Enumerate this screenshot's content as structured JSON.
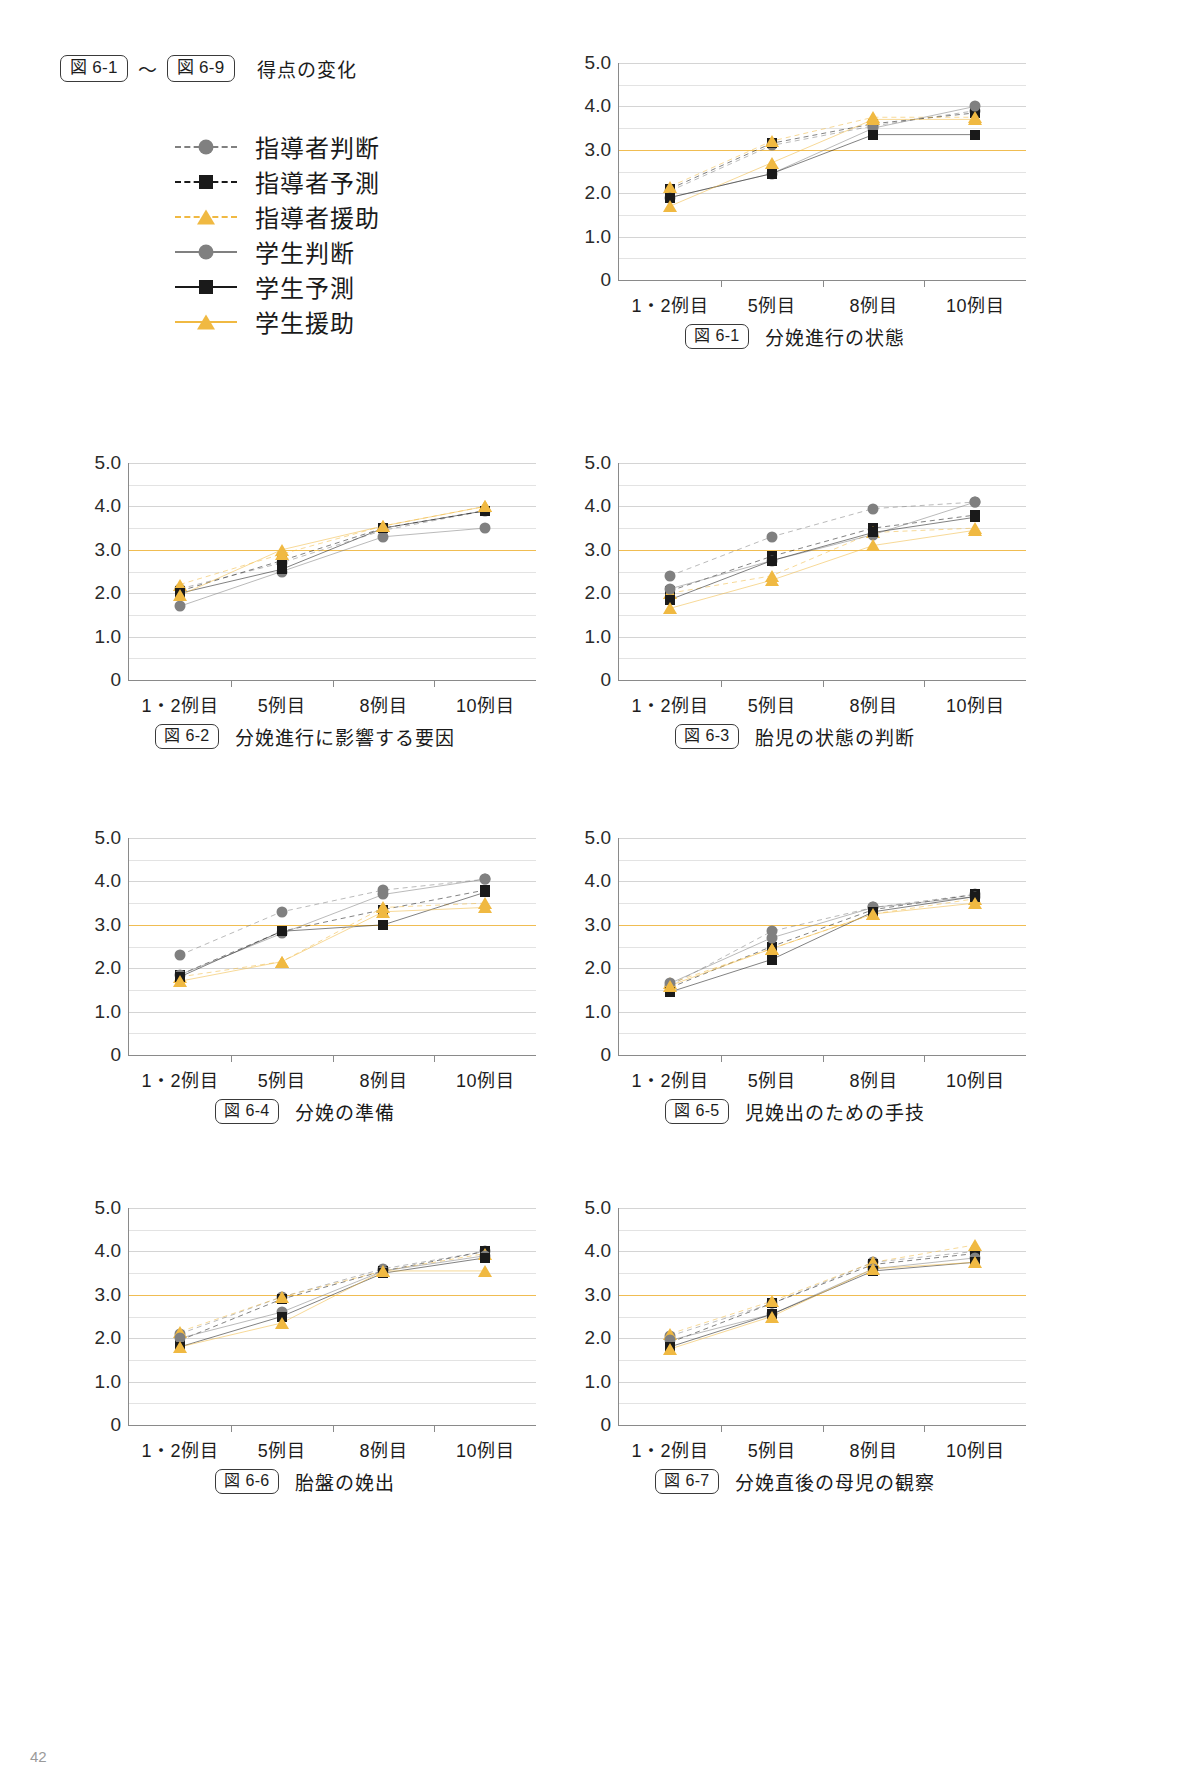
{
  "header": {
    "tag_start": "図 6-1",
    "tilde": "〜",
    "tag_end": "図 6-9",
    "title": "得点の変化"
  },
  "colors": {
    "gray": "#808080",
    "black": "#1a1a1a",
    "orange": "#f0b942",
    "refline": "#f0bd52",
    "grid": "#e3e3e3",
    "axis": "#8a8a8a"
  },
  "legend": {
    "items": [
      {
        "label": "指導者判断",
        "marker": "circle",
        "color": "#808080",
        "dash": true
      },
      {
        "label": "指導者予測",
        "marker": "square",
        "color": "#1a1a1a",
        "dash": true
      },
      {
        "label": "指導者援助",
        "marker": "triangle",
        "color": "#f0b942",
        "dash": true
      },
      {
        "label": "学生判断",
        "marker": "circle",
        "color": "#808080",
        "dash": false
      },
      {
        "label": "学生予測",
        "marker": "square",
        "color": "#1a1a1a",
        "dash": false
      },
      {
        "label": "学生援助",
        "marker": "triangle",
        "color": "#f0b942",
        "dash": false
      }
    ]
  },
  "axis": {
    "ylim": [
      0,
      5.0
    ],
    "yticks": [
      "0",
      "1.0",
      "2.0",
      "3.0",
      "4.0",
      "5.0"
    ],
    "ytick_values": [
      0,
      1.0,
      2.0,
      3.0,
      4.0,
      5.0
    ],
    "minor_step": 0.5,
    "reference_line": 3.0,
    "categories": [
      "1・2例目",
      "5例目",
      "8例目",
      "10例目"
    ]
  },
  "chart_data": [
    {
      "id": "fig6-1",
      "type": "line",
      "tag": "図 6-1",
      "title": "分娩進行の状態",
      "categories": [
        "1・2例目",
        "5例目",
        "8例目",
        "10例目"
      ],
      "xlabel": "",
      "ylabel": "",
      "ylim": [
        0,
        5.0
      ],
      "grid": true,
      "reference_line": 3.0,
      "legend_position": "external-top-left",
      "series": [
        {
          "name": "指導者判断",
          "values": [
            2.05,
            3.1,
            3.55,
            3.9
          ]
        },
        {
          "name": "指導者予測",
          "values": [
            2.1,
            3.15,
            3.6,
            3.85
          ]
        },
        {
          "name": "指導者援助",
          "values": [
            2.15,
            3.2,
            3.75,
            3.75
          ]
        },
        {
          "name": "学生判断",
          "values": [
            1.9,
            2.45,
            3.5,
            4.0
          ]
        },
        {
          "name": "学生予測",
          "values": [
            1.9,
            2.45,
            3.35,
            3.35
          ]
        },
        {
          "name": "学生援助",
          "values": [
            1.7,
            2.7,
            3.7,
            3.7
          ]
        }
      ]
    },
    {
      "id": "fig6-2",
      "type": "line",
      "tag": "図 6-2",
      "title": "分娩進行に影響する要因",
      "categories": [
        "1・2例目",
        "5例目",
        "8例目",
        "10例目"
      ],
      "xlabel": "",
      "ylabel": "",
      "ylim": [
        0,
        5.0
      ],
      "grid": true,
      "reference_line": 3.0,
      "legend_position": "external-top-left",
      "series": [
        {
          "name": "指導者判断",
          "values": [
            2.1,
            2.7,
            3.45,
            3.9
          ]
        },
        {
          "name": "指導者予測",
          "values": [
            2.05,
            2.75,
            3.5,
            3.9
          ]
        },
        {
          "name": "指導者援助",
          "values": [
            2.2,
            2.9,
            3.55,
            4.0
          ]
        },
        {
          "name": "学生判断",
          "values": [
            1.7,
            2.5,
            3.3,
            3.5
          ]
        },
        {
          "name": "学生予測",
          "values": [
            2.0,
            2.55,
            3.5,
            3.9
          ]
        },
        {
          "name": "学生援助",
          "values": [
            1.95,
            3.0,
            3.55,
            4.0
          ]
        }
      ]
    },
    {
      "id": "fig6-3",
      "type": "line",
      "tag": "図 6-3",
      "title": "胎児の状態の判断",
      "categories": [
        "1・2例目",
        "5例目",
        "8例目",
        "10例目"
      ],
      "xlabel": "",
      "ylabel": "",
      "ylim": [
        0,
        5.0
      ],
      "grid": true,
      "reference_line": 3.0,
      "legend_position": "external-top-left",
      "series": [
        {
          "name": "指導者判断",
          "values": [
            2.4,
            3.3,
            3.95,
            4.1
          ]
        },
        {
          "name": "指導者予測",
          "values": [
            2.05,
            2.85,
            3.5,
            3.8
          ]
        },
        {
          "name": "指導者援助",
          "values": [
            2.0,
            2.4,
            3.4,
            3.5
          ]
        },
        {
          "name": "学生判断",
          "values": [
            2.1,
            2.75,
            3.35,
            4.1
          ]
        },
        {
          "name": "学生予測",
          "values": [
            1.85,
            2.75,
            3.4,
            3.75
          ]
        },
        {
          "name": "学生援助",
          "values": [
            1.65,
            2.3,
            3.1,
            3.45
          ]
        }
      ]
    },
    {
      "id": "fig6-4",
      "type": "line",
      "tag": "図 6-4",
      "title": "分娩の準備",
      "categories": [
        "1・2例目",
        "5例目",
        "8例目",
        "10例目"
      ],
      "xlabel": "",
      "ylabel": "",
      "ylim": [
        0,
        5.0
      ],
      "grid": true,
      "reference_line": 3.0,
      "legend_position": "external-top-left",
      "series": [
        {
          "name": "指導者判断",
          "values": [
            2.3,
            3.3,
            3.8,
            4.05
          ]
        },
        {
          "name": "指導者予測",
          "values": [
            1.85,
            2.85,
            3.35,
            3.8
          ]
        },
        {
          "name": "指導者援助",
          "values": [
            1.8,
            2.15,
            3.4,
            3.5
          ]
        },
        {
          "name": "学生判断",
          "values": [
            1.85,
            2.8,
            3.7,
            4.05
          ]
        },
        {
          "name": "学生予測",
          "values": [
            1.8,
            2.85,
            3.0,
            3.75
          ]
        },
        {
          "name": "学生援助",
          "values": [
            1.7,
            2.15,
            3.3,
            3.4
          ]
        }
      ]
    },
    {
      "id": "fig6-5",
      "type": "line",
      "tag": "図 6-5",
      "title": "児娩出のための手技",
      "categories": [
        "1・2例目",
        "5例目",
        "8例目",
        "10例目"
      ],
      "xlabel": "",
      "ylabel": "",
      "ylim": [
        0,
        5.0
      ],
      "grid": true,
      "reference_line": 3.0,
      "legend_position": "external-top-left",
      "series": [
        {
          "name": "指導者判断",
          "values": [
            1.6,
            2.85,
            3.4,
            3.7
          ]
        },
        {
          "name": "指導者予測",
          "values": [
            1.55,
            2.5,
            3.35,
            3.7
          ]
        },
        {
          "name": "指導者援助",
          "values": [
            1.65,
            2.45,
            3.25,
            3.6
          ]
        },
        {
          "name": "学生判断",
          "values": [
            1.65,
            2.7,
            3.4,
            3.65
          ]
        },
        {
          "name": "学生予測",
          "values": [
            1.45,
            2.2,
            3.3,
            3.65
          ]
        },
        {
          "name": "学生援助",
          "values": [
            1.6,
            2.45,
            3.25,
            3.5
          ]
        }
      ]
    },
    {
      "id": "fig6-6",
      "type": "line",
      "tag": "図 6-6",
      "title": "胎盤の娩出",
      "categories": [
        "1・2例目",
        "5例目",
        "8例目",
        "10例目"
      ],
      "xlabel": "",
      "ylabel": "",
      "ylim": [
        0,
        5.0
      ],
      "grid": true,
      "reference_line": 3.0,
      "legend_position": "external-top-left",
      "series": [
        {
          "name": "指導者判断",
          "values": [
            2.1,
            2.95,
            3.6,
            4.0
          ]
        },
        {
          "name": "指導者予測",
          "values": [
            1.95,
            2.9,
            3.55,
            4.0
          ]
        },
        {
          "name": "指導者援助",
          "values": [
            2.15,
            2.95,
            3.55,
            3.95
          ]
        },
        {
          "name": "学生判断",
          "values": [
            2.0,
            2.6,
            3.55,
            3.9
          ]
        },
        {
          "name": "学生予測",
          "values": [
            1.8,
            2.5,
            3.5,
            3.85
          ]
        },
        {
          "name": "学生援助",
          "values": [
            1.8,
            2.35,
            3.55,
            3.55
          ]
        }
      ]
    },
    {
      "id": "fig6-7",
      "type": "line",
      "tag": "図 6-7",
      "title": "分娩直後の母児の観察",
      "categories": [
        "1・2例目",
        "5例目",
        "8例目",
        "10例目"
      ],
      "xlabel": "",
      "ylabel": "",
      "ylim": [
        0,
        5.0
      ],
      "grid": true,
      "reference_line": 3.0,
      "legend_position": "external-top-left",
      "series": [
        {
          "name": "指導者判断",
          "values": [
            2.05,
            2.8,
            3.75,
            4.0
          ]
        },
        {
          "name": "指導者予測",
          "values": [
            1.9,
            2.8,
            3.7,
            3.95
          ]
        },
        {
          "name": "指導者援助",
          "values": [
            2.1,
            2.85,
            3.75,
            4.15
          ]
        },
        {
          "name": "学生判断",
          "values": [
            1.95,
            2.55,
            3.6,
            3.85
          ]
        },
        {
          "name": "学生予測",
          "values": [
            1.8,
            2.55,
            3.55,
            3.75
          ]
        },
        {
          "name": "学生援助",
          "values": [
            1.75,
            2.5,
            3.6,
            3.75
          ]
        }
      ]
    }
  ],
  "page_number": "42"
}
